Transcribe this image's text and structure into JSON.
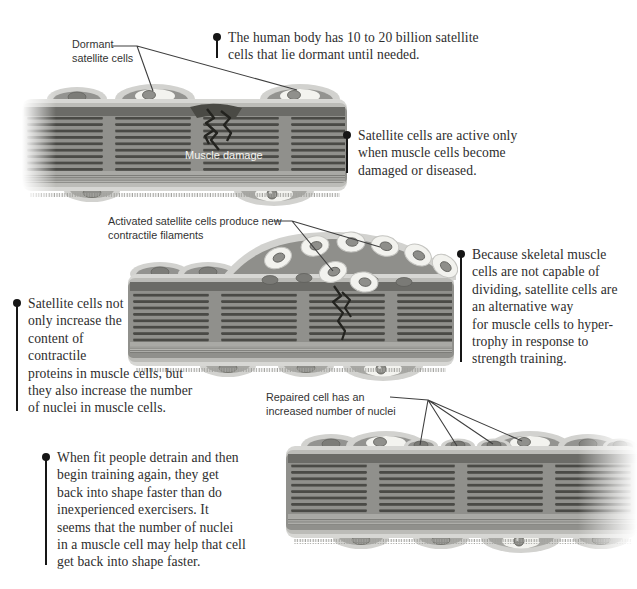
{
  "figure": {
    "muscle_damage_label": "Muscle damage"
  },
  "labels": {
    "dormant": "Dormant\nsatellite cells",
    "activated": "Activated satellite cells produce new\ncontractile filaments",
    "repaired": "Repaired cell has an\nincreased number of nuclei"
  },
  "notes": {
    "dormant_count": "The human body has 10 to 20 billion satellite\ncells that lie dormant until needed.",
    "active_when": "Satellite cells are active only\nwhen muscle cells become\ndamaged or diseased.",
    "hypertrophy": "Because skeletal muscle\ncells are not capable of\ndividing, satellite cells are\nan alternative way\nfor muscle cells to hyper-\ntrophy in response to\nstrength training.",
    "nuclei_increase": "Satellite cells not\nonly increase the\ncontent of\ncontractile\nproteins in muscle cells, but\nthey also increase the number\nof nuclei in muscle cells.",
    "detrain": "When fit people detrain and then\nbegin training again, they get\nback into shape faster than do\ninexperienced exercisers.  It\nseems that the number of nuclei\nin a muscle cell may help that cell\nget back into shape faster."
  },
  "colors": {
    "background": "#ffffff",
    "note_text": "#2d2d2d",
    "pin": "#161616",
    "leader_line": "#3f3f3f",
    "membrane_outer": "#d7d7d4",
    "membrane_mid": "#bcbcb8",
    "fiber_core": "#90908c",
    "fiber_top_strip": "#6b6b67",
    "striation_dark": "#4a4a46",
    "satellite_cell": "#f3f3ef",
    "nucleus": "#8e8e8a",
    "damage_crack": "#23231f",
    "damage_text": "#f4f4f0"
  }
}
